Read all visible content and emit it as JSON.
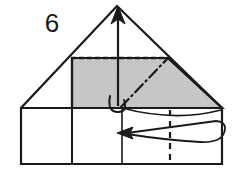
{
  "figure": {
    "kind": "origami-fold-diagram",
    "step_label": "6",
    "step_label_x": 52,
    "step_label_y": 32,
    "background_color": "#ffffff",
    "line_color": "#1a1a1a",
    "shaded_color": "#c8c8c8",
    "shaded_stroke": "#1a1a1a",
    "canvas": {
      "width": 236,
      "height": 177
    }
  },
  "geometry": {
    "apex": {
      "x": 117,
      "y": 6
    },
    "left_corner": {
      "x": 21,
      "y": 108
    },
    "right_corner": {
      "x": 222,
      "y": 108
    },
    "bottom_left": {
      "x": 21,
      "y": 164
    },
    "bottom_right": {
      "x": 222,
      "y": 164
    },
    "horizontal_band_y": 108,
    "crease_dashed_y": 58,
    "crease_dashed_x1": 72,
    "crease_dashed_x2": 168,
    "shaded_left_x": 72,
    "shaded_right_x": 168,
    "vertical_solid_1_x": 72,
    "vertical_solid_2_x": 122,
    "vertical_dashed_x": 170
  },
  "shapes": [
    {
      "name": "outer-silhouette",
      "type": "polygon",
      "points": "117,6 222,108 222,164 21,164 21,108",
      "fill": "#ffffff",
      "stroke": "#1a1a1a",
      "stroke_width": 2.2
    },
    {
      "name": "shaded-flap-region",
      "type": "polygon",
      "points": "72,58 168,58 222,108 72,108",
      "fill": "#c8c8c8",
      "stroke": "#1a1a1a",
      "stroke_width": 2.2
    }
  ],
  "creases": [
    {
      "name": "horizontal-valley-crease",
      "style": "dashed",
      "x1": 72,
      "y1": 58,
      "x2": 168,
      "y2": 58,
      "dash": "5,3"
    },
    {
      "name": "diagonal-mountain-crease",
      "style": "dash-dot",
      "x1": 121,
      "y1": 107,
      "x2": 168,
      "y2": 58,
      "dash": "9,4,1.5,4"
    },
    {
      "name": "vertical-dashed-crease",
      "style": "dashed",
      "x1": 170,
      "y1": 110,
      "x2": 170,
      "y2": 163,
      "dash": "6,5"
    }
  ],
  "edges": [
    {
      "name": "band-top-edge",
      "x1": 21,
      "y1": 108,
      "x2": 222,
      "y2": 108
    },
    {
      "name": "vertical-edge-left",
      "x1": 72,
      "y1": 108,
      "x2": 72,
      "y2": 164
    },
    {
      "name": "vertical-edge-mid",
      "x1": 122,
      "y1": 108,
      "x2": 122,
      "y2": 164
    }
  ],
  "arrows": [
    {
      "name": "unfold-up-arrow",
      "description": "straight arrow pointing up to apex with small hook loop at its tail",
      "tip": {
        "x": 118,
        "y": 7
      },
      "tail": {
        "x": 118,
        "y": 106
      },
      "has_hook": true,
      "hook_cx": 116,
      "hook_cy": 108
    },
    {
      "name": "wrap-left-arrow",
      "description": "curved arrow wrapping from right edge to the left",
      "tip": {
        "x": 118,
        "y": 133
      },
      "tail": {
        "x": 222,
        "y": 133
      },
      "curved": true
    },
    {
      "name": "flap-lift-curve",
      "description": "shallow curve under shaded flap indicating lifted layer",
      "from": {
        "x": 122,
        "y": 108
      },
      "to": {
        "x": 222,
        "y": 112
      }
    }
  ]
}
